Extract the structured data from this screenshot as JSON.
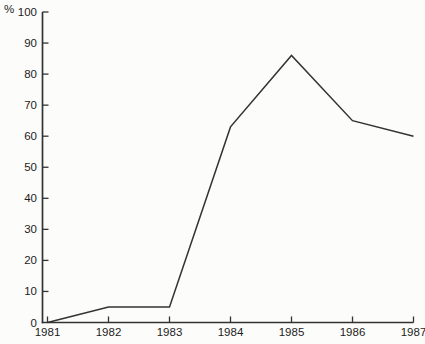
{
  "chart": {
    "unit_label": "%"
  },
  "chart_data": {
    "type": "line",
    "title": "",
    "categories": [
      "1981",
      "1982",
      "1983",
      "1984",
      "1985",
      "1986",
      "1987"
    ],
    "values": [
      0,
      5,
      5,
      63,
      86,
      65,
      60
    ],
    "xlabel": "",
    "ylabel": "%",
    "ylim": [
      0,
      100
    ],
    "y_ticks": [
      0,
      10,
      20,
      30,
      40,
      50,
      60,
      70,
      80,
      90,
      100
    ],
    "grid": "off",
    "legend": "none",
    "colors": {
      "line": "#333333",
      "axis": "#333333",
      "text": "#1c1c1c",
      "background": "#fcfcfa"
    }
  }
}
